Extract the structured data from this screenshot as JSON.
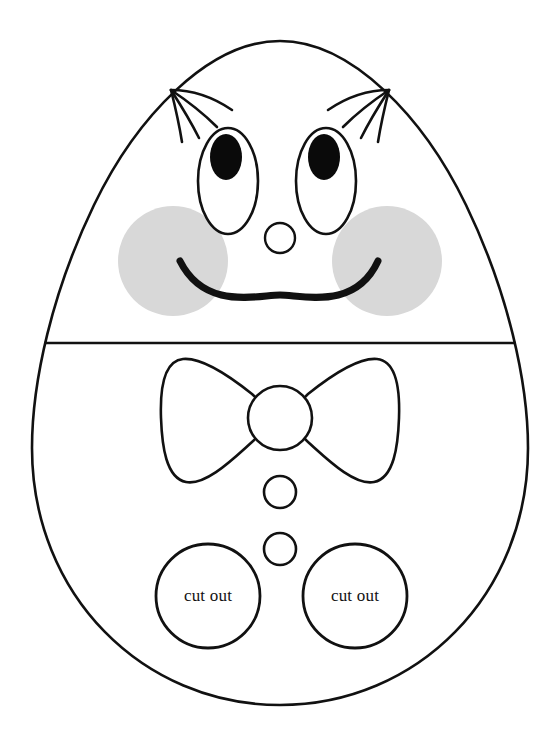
{
  "page": {
    "background_color": "#ffffff",
    "width": 560,
    "height": 756
  },
  "colors": {
    "outline": "#111111",
    "cheek_fill": "#d8d8d8",
    "pupil_fill": "#0a0a0a",
    "paper": "#ffffff"
  },
  "figure": {
    "name": "egg-character",
    "outline_label": "egg body outline",
    "divider_label": "horizontal split line",
    "top_y": 41,
    "bottom_y": 705,
    "left_x": 31,
    "right_x": 528,
    "divider_y": 343
  },
  "face": {
    "eyes": [
      {
        "side": "left",
        "cx": 228,
        "cy": 181,
        "rx": 30,
        "ry": 53
      },
      {
        "side": "right",
        "cx": 326,
        "cy": 181,
        "rx": 30,
        "ry": 53
      }
    ],
    "pupils": [
      {
        "side": "left",
        "cx": 226,
        "cy": 157,
        "rx": 16,
        "ry": 23
      },
      {
        "side": "right",
        "cx": 324,
        "cy": 157,
        "rx": 16,
        "ry": 23
      }
    ],
    "eyelashes": {
      "left_count": 4,
      "right_count": 4,
      "label": "eyelash strokes"
    },
    "nose": {
      "cx": 280,
      "cy": 238,
      "r": 15
    },
    "cheeks": [
      {
        "side": "left",
        "cx": 173,
        "cy": 261,
        "r": 55
      },
      {
        "side": "right",
        "cx": 387,
        "cy": 261,
        "r": 55
      }
    ],
    "mouth": {
      "label": "smiling mouth arc",
      "stroke_width": 7
    }
  },
  "body": {
    "bowtie": {
      "label": "bow tie",
      "knot": {
        "cx": 280,
        "cy": 418,
        "r": 32
      },
      "left_wing_label": "bow tie left wing",
      "right_wing_label": "bow tie right wing"
    },
    "buttons": [
      {
        "index": 1,
        "cx": 280,
        "cy": 492,
        "r": 16
      },
      {
        "index": 2,
        "cx": 280,
        "cy": 549,
        "r": 16
      }
    ],
    "cutout_holes": [
      {
        "side": "left",
        "cx": 208,
        "cy": 596,
        "r": 52,
        "label": "cut out"
      },
      {
        "side": "right",
        "cx": 355,
        "cy": 596,
        "r": 52,
        "label": "cut out"
      }
    ]
  },
  "labels": {
    "cut_out_left": "cut out",
    "cut_out_right": "cut out"
  }
}
